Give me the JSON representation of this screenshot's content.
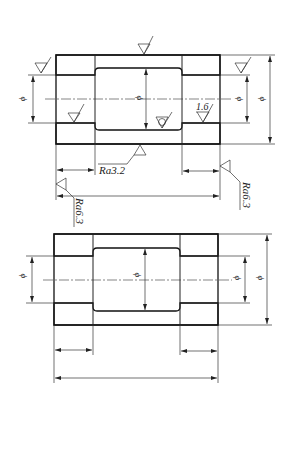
{
  "drawing": {
    "title": "Bushing section drawings with dimensions and surface roughness",
    "top_view": {
      "diameter_symbol": "ϕ",
      "roughness_labels": {
        "bottom_center": "Ra3.2",
        "right_bottom": "Ra6.3",
        "left_bottom": "Ra6.3",
        "right_bore": "1.6"
      }
    },
    "bottom_view": {
      "diameter_symbol": "ϕ"
    }
  }
}
